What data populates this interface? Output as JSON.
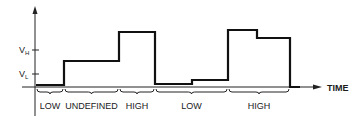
{
  "diagram": {
    "y_axis": {
      "ticks": [
        {
          "label": "V",
          "sub": "H",
          "y": 50
        },
        {
          "label": "V",
          "sub": "L",
          "y": 74
        }
      ]
    },
    "x_axis": {
      "label": "TIME"
    },
    "waveform": {
      "points": "36,85 64,85 64,61 119,61 119,32 155,32 155,84 192,84 192,80 228,80 228,30 257,30 257,38 290,38 290,87 300,87",
      "color": "#111111"
    },
    "regions": [
      {
        "label": "LOW",
        "x1": 36,
        "x2": 64
      },
      {
        "label": "UNDEFINED",
        "x1": 64,
        "x2": 119
      },
      {
        "label": "HIGH",
        "x1": 119,
        "x2": 155
      },
      {
        "label": "LOW",
        "x1": 155,
        "x2": 228
      },
      {
        "label": "HIGH",
        "x1": 228,
        "x2": 290
      }
    ]
  }
}
